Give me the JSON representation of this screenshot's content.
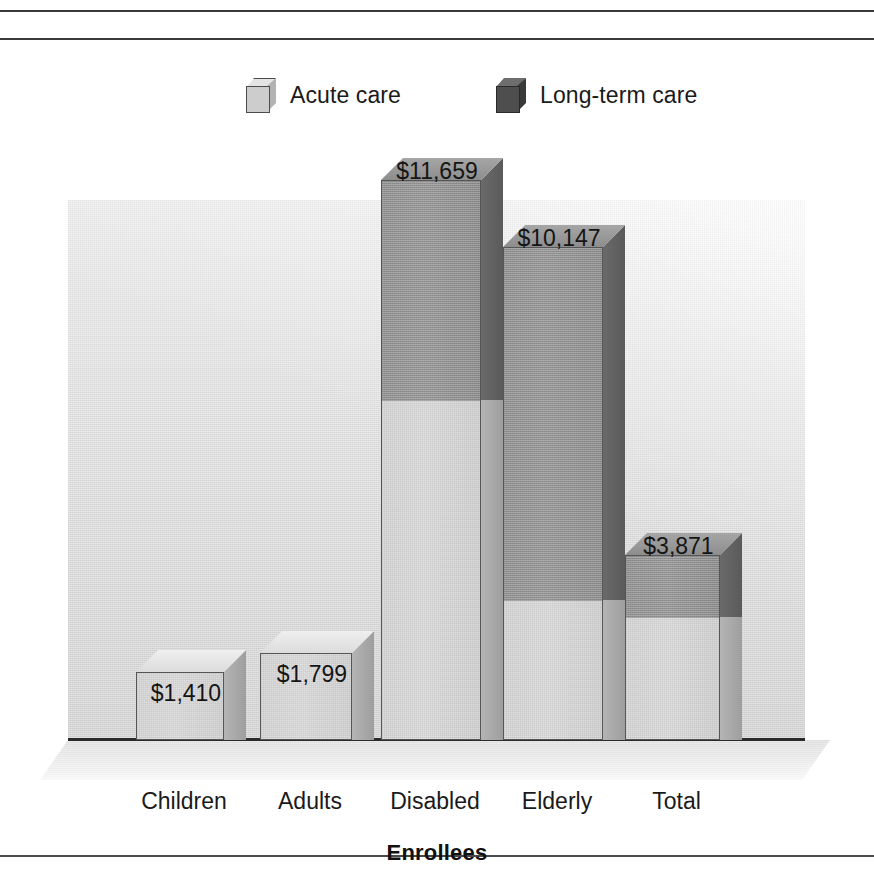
{
  "figure": {
    "axis_title": "Enrollees",
    "legend": [
      {
        "key": "acute",
        "label": "Acute care",
        "color": "#d4d4d4",
        "icon": "cube-icon"
      },
      {
        "key": "ltc",
        "label": "Long-term care",
        "color": "#4e4e4e",
        "icon": "cube-icon"
      }
    ],
    "bars": [
      {
        "category": "Children",
        "label": "$1,410",
        "left": 136,
        "width": 88,
        "acute_px": 68,
        "ltc_px": 0,
        "label_top": 640
      },
      {
        "category": "Adults",
        "label": "$1,799",
        "left": 260,
        "width": 92,
        "acute_px": 87,
        "ltc_px": 0,
        "label_top": 621
      },
      {
        "category": "Disabled",
        "label": "$11,659",
        "left": 381,
        "width": 100,
        "acute_px": 340,
        "ltc_px": 220,
        "label_top": 118
      },
      {
        "category": "Elderly",
        "label": "$10,147",
        "left": 503,
        "width": 100,
        "acute_px": 140,
        "ltc_px": 353,
        "label_top": 185
      },
      {
        "category": "Total",
        "label": "$3,871",
        "left": 625,
        "width": 95,
        "acute_px": 123,
        "ltc_px": 62,
        "label_top": 493
      }
    ]
  },
  "chart_data": {
    "type": "bar",
    "title": "",
    "subtitle": "",
    "xlabel": "Enrollees",
    "ylabel": "",
    "stacked": true,
    "grid": false,
    "legend_position": "top",
    "value_prefix": "$",
    "categories": [
      "Children",
      "Adults",
      "Disabled",
      "Elderly",
      "Total"
    ],
    "totals": [
      1410,
      1799,
      11659,
      10147,
      3871
    ],
    "total_labels": [
      "$1,410",
      "$1,799",
      "$11,659",
      "$10,147",
      "$3,871"
    ],
    "series": [
      {
        "name": "Acute care",
        "color": "#d4d4d4",
        "values": [
          1410,
          1799,
          7080,
          2915,
          2560
        ]
      },
      {
        "name": "Long-term care",
        "color": "#4e4e4e",
        "values": [
          0,
          0,
          4579,
          7232,
          1311
        ]
      }
    ],
    "ylim": [
      0,
      11659
    ]
  }
}
